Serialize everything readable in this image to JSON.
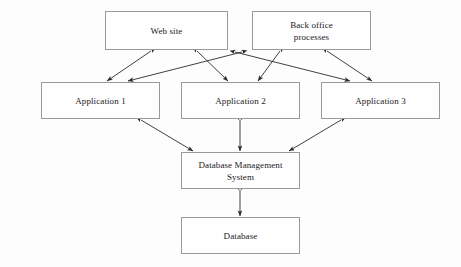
{
  "diagram": {
    "background_color": "#fdfdfd",
    "box_border_color": "#9a9a9a",
    "box_fill_color": "#fefefe",
    "arrow_color": "#2b2b2b",
    "text_color": "#1b1b1b",
    "nodes": [
      {
        "id": "web-site",
        "label": "Web site",
        "x": 105,
        "y": 11,
        "width": 123,
        "height": 39
      },
      {
        "id": "back-office-processes",
        "label": "Back office\nprocesses",
        "x": 252,
        "y": 11,
        "width": 119,
        "height": 39
      },
      {
        "id": "application-1",
        "label": "Application 1",
        "x": 41,
        "y": 82,
        "width": 119,
        "height": 37
      },
      {
        "id": "application-2",
        "label": "Application 2",
        "x": 181,
        "y": 82,
        "width": 119,
        "height": 37
      },
      {
        "id": "application-3",
        "label": "Application 3",
        "x": 321,
        "y": 82,
        "width": 119,
        "height": 37
      },
      {
        "id": "database-management-system",
        "label": "Database Management\nSystem",
        "x": 181,
        "y": 152,
        "width": 119,
        "height": 37
      },
      {
        "id": "database",
        "label": "Database",
        "x": 181,
        "y": 217,
        "width": 119,
        "height": 37
      }
    ],
    "connectors": [
      {
        "id": "web-site-to-application-1",
        "from": "web-site",
        "to": "application-1",
        "style": "double-arrow",
        "x1": 151,
        "y1": 51,
        "x2": 107,
        "y2": 81
      },
      {
        "id": "web-site-to-application-2",
        "from": "web-site",
        "to": "application-2",
        "style": "double-arrow",
        "x1": 197,
        "y1": 51,
        "x2": 228,
        "y2": 81
      },
      {
        "id": "web-site-to-application-3",
        "from": "web-site",
        "to": "application-3",
        "style": "double-arrow",
        "x1": 235,
        "y1": 52,
        "x2": 350,
        "y2": 81
      },
      {
        "id": "back-office-to-application-1",
        "from": "back-office-processes",
        "to": "application-1",
        "style": "double-arrow",
        "x1": 242,
        "y1": 52,
        "x2": 128,
        "y2": 81
      },
      {
        "id": "back-office-to-application-2",
        "from": "back-office-processes",
        "to": "application-2",
        "style": "double-arrow",
        "x1": 280,
        "y1": 51,
        "x2": 258,
        "y2": 81
      },
      {
        "id": "back-office-to-application-3",
        "from": "back-office-processes",
        "to": "application-3",
        "style": "double-arrow",
        "x1": 327,
        "y1": 51,
        "x2": 372,
        "y2": 81
      },
      {
        "id": "application-1-to-dbms",
        "from": "application-1",
        "to": "database-management-system",
        "style": "double-arrow",
        "x1": 141,
        "y1": 120,
        "x2": 193,
        "y2": 151
      },
      {
        "id": "application-2-to-dbms",
        "from": "application-2",
        "to": "database-management-system",
        "style": "double-arrow",
        "x1": 240,
        "y1": 120,
        "x2": 240,
        "y2": 151
      },
      {
        "id": "application-3-to-dbms",
        "from": "application-3",
        "to": "database-management-system",
        "style": "double-arrow",
        "x1": 341,
        "y1": 120,
        "x2": 289,
        "y2": 151
      },
      {
        "id": "dbms-to-database",
        "from": "database-management-system",
        "to": "database",
        "style": "double-arrow",
        "x1": 240,
        "y1": 190,
        "x2": 240,
        "y2": 216
      }
    ]
  }
}
